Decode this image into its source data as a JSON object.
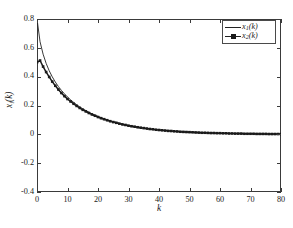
{
  "chart_data": {
    "type": "line",
    "title": "",
    "xlabel": "k",
    "ylabel": "x_i(k)",
    "ylabel_base": "x",
    "ylabel_sub": "i",
    "ylabel_tail": "(k)",
    "xlim": [
      0,
      80
    ],
    "ylim": [
      -0.4,
      0.8
    ],
    "xticks": [
      0,
      10,
      20,
      30,
      40,
      50,
      60,
      70,
      80
    ],
    "xtick_labels": [
      "0",
      "10",
      "20",
      "30",
      "40",
      "50",
      "60",
      "70",
      "80"
    ],
    "yticks": [
      0.8,
      0.6,
      0.4,
      0.2,
      0,
      -0.2,
      -0.4
    ],
    "ytick_labels": [
      "0.8",
      "0.6",
      "0.4",
      "0.2",
      "0",
      "-0.2",
      "-0.4"
    ],
    "grid": false,
    "legend_position": "top-right",
    "box": true,
    "tick_direction": "in",
    "series": [
      {
        "name": "x1(k)",
        "label_base": "x",
        "label_sub": "1",
        "label_tail": "(k)",
        "style": "solid-line",
        "color": "#222222",
        "linewidth": 0.9,
        "marker": "none",
        "x": [
          0,
          1,
          2,
          3,
          4,
          5,
          6,
          7,
          8,
          9,
          10,
          11,
          12,
          13,
          14,
          15,
          16,
          17,
          18,
          19,
          20,
          21,
          22,
          23,
          24,
          25,
          26,
          27,
          28,
          29,
          30,
          31,
          32,
          33,
          34,
          35,
          36,
          37,
          38,
          39,
          40,
          42,
          44,
          46,
          48,
          50,
          52,
          54,
          56,
          58,
          60,
          62,
          64,
          66,
          68,
          70,
          72,
          74,
          76,
          78,
          80
        ],
        "y": [
          0.8,
          0.642,
          0.556,
          0.492,
          0.441,
          0.399,
          0.363,
          0.332,
          0.305,
          0.281,
          0.259,
          0.24,
          0.222,
          0.206,
          0.191,
          0.178,
          0.165,
          0.154,
          0.143,
          0.133,
          0.124,
          0.116,
          0.108,
          0.1,
          0.094,
          0.087,
          0.081,
          0.076,
          0.071,
          0.066,
          0.061,
          0.057,
          0.053,
          0.05,
          0.046,
          0.043,
          0.04,
          0.037,
          0.035,
          0.032,
          0.03,
          0.026,
          0.023,
          0.02,
          0.017,
          0.015,
          0.013,
          0.011,
          0.01,
          0.009,
          0.008,
          0.007,
          0.006,
          0.005,
          0.004,
          0.004,
          0.003,
          0.003,
          0.002,
          0.002,
          0.002
        ]
      },
      {
        "name": "x2(k)",
        "label_base": "x",
        "label_sub": "2",
        "label_tail": "(k)",
        "style": "line-with-markers",
        "color": "#1a1a1a",
        "linewidth": 1.5,
        "marker": "square-filled",
        "marker_size": 2.6,
        "x": [
          0,
          1,
          2,
          3,
          4,
          5,
          6,
          7,
          8,
          9,
          10,
          11,
          12,
          13,
          14,
          15,
          16,
          17,
          18,
          19,
          20,
          21,
          22,
          23,
          24,
          25,
          26,
          27,
          28,
          29,
          30,
          31,
          32,
          33,
          34,
          35,
          36,
          37,
          38,
          39,
          40,
          41,
          42,
          43,
          44,
          45,
          46,
          47,
          48,
          49,
          50,
          51,
          52,
          53,
          54,
          55,
          56,
          57,
          58,
          59,
          60,
          61,
          62,
          63,
          64,
          65,
          66,
          67,
          68,
          69,
          70,
          71,
          72,
          73,
          74,
          75,
          76,
          77,
          78,
          79,
          80
        ],
        "y": [
          0.5,
          0.512,
          0.47,
          0.432,
          0.398,
          0.366,
          0.337,
          0.311,
          0.287,
          0.265,
          0.245,
          0.228,
          0.212,
          0.197,
          0.183,
          0.17,
          0.159,
          0.148,
          0.138,
          0.129,
          0.12,
          0.112,
          0.105,
          0.098,
          0.091,
          0.085,
          0.08,
          0.074,
          0.069,
          0.065,
          0.06,
          0.056,
          0.053,
          0.049,
          0.046,
          0.043,
          0.04,
          0.037,
          0.035,
          0.032,
          0.03,
          0.028,
          0.026,
          0.024,
          0.023,
          0.021,
          0.02,
          0.018,
          0.017,
          0.016,
          0.015,
          0.014,
          0.013,
          0.012,
          0.011,
          0.011,
          0.01,
          0.009,
          0.009,
          0.008,
          0.008,
          0.007,
          0.007,
          0.006,
          0.006,
          0.005,
          0.005,
          0.005,
          0.004,
          0.004,
          0.004,
          0.004,
          0.003,
          0.003,
          0.003,
          0.003,
          0.002,
          0.002,
          0.002,
          0.002,
          0.002
        ]
      }
    ]
  },
  "legend": {
    "entries": [
      {
        "base": "x",
        "sub": "1",
        "tail": "(k)"
      },
      {
        "base": "x",
        "sub": "2",
        "tail": "(k)"
      }
    ]
  }
}
